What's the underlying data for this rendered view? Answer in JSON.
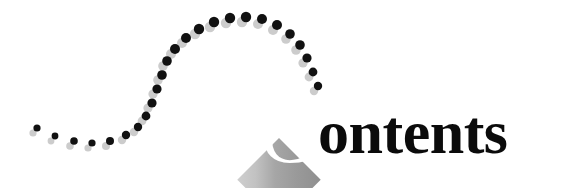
{
  "page": {
    "background_color": "#ffffff",
    "width": 567,
    "height": 192
  },
  "heading": {
    "full_text": "Contents",
    "drop_cap": "C",
    "rest_text": "ontents",
    "text_color": "#0b0b0b",
    "drop_cap_color": "#ffffff"
  },
  "diamond": {
    "name": "diamond-badge",
    "fill_dark": "#9a9a9a",
    "fill_light": "#c9c9c9",
    "rotation_degrees": 45,
    "center_x": 279,
    "center_y": 138,
    "size": 59
  },
  "dot_trail": {
    "name": "decorative-dot-trail",
    "dot_color": "#111111",
    "shadow_color": "#cccccc",
    "shadow_offset_x": -4,
    "shadow_offset_y": 5,
    "dots": [
      {
        "x": 37,
        "y": 128,
        "r": 3.6
      },
      {
        "x": 55,
        "y": 136,
        "r": 3.4
      },
      {
        "x": 74,
        "y": 141,
        "r": 3.8
      },
      {
        "x": 92,
        "y": 143,
        "r": 3.6
      },
      {
        "x": 110,
        "y": 141,
        "r": 4.0
      },
      {
        "x": 126,
        "y": 135,
        "r": 4.2
      },
      {
        "x": 138,
        "y": 127,
        "r": 4.2
      },
      {
        "x": 146,
        "y": 116,
        "r": 4.4
      },
      {
        "x": 152,
        "y": 103,
        "r": 4.6
      },
      {
        "x": 157,
        "y": 89,
        "r": 4.6
      },
      {
        "x": 162,
        "y": 75,
        "r": 4.8
      },
      {
        "x": 167,
        "y": 61,
        "r": 4.8
      },
      {
        "x": 175,
        "y": 49,
        "r": 5.0
      },
      {
        "x": 186,
        "y": 38,
        "r": 5.0
      },
      {
        "x": 199,
        "y": 29,
        "r": 5.2
      },
      {
        "x": 214,
        "y": 22,
        "r": 5.2
      },
      {
        "x": 230,
        "y": 18,
        "r": 5.2
      },
      {
        "x": 246,
        "y": 17,
        "r": 5.2
      },
      {
        "x": 262,
        "y": 19,
        "r": 5.0
      },
      {
        "x": 277,
        "y": 25,
        "r": 5.0
      },
      {
        "x": 290,
        "y": 34,
        "r": 4.8
      },
      {
        "x": 300,
        "y": 45,
        "r": 4.8
      },
      {
        "x": 307,
        "y": 58,
        "r": 4.6
      },
      {
        "x": 313,
        "y": 72,
        "r": 4.4
      },
      {
        "x": 318,
        "y": 86,
        "r": 4.2
      }
    ]
  }
}
